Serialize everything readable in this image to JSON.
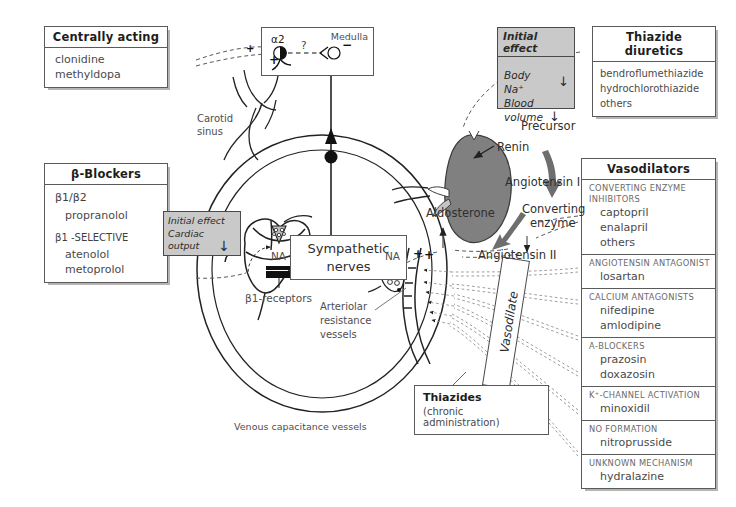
{
  "boxes": {
    "centrally_acting": {
      "header": "Centrally acting",
      "drugs": [
        "clonidine",
        "methyldopa"
      ]
    },
    "thiazide_diuretics": {
      "header": "Thiazide diuretics",
      "drugs": [
        "bendroflumethiazide",
        "hydrochlorothiazide",
        "others"
      ]
    },
    "beta_blockers": {
      "header": "β-Blockers",
      "group1_label": "β1/β2",
      "group1_drugs": [
        "propranolol"
      ],
      "group2_label": "β1 -SELECTIVE",
      "group2_drugs": [
        "atenolol",
        "metoprolol"
      ]
    },
    "vasodilators": {
      "header": "Vasodilators",
      "sections": [
        {
          "category": "CONVERTING ENZYME INHIBITORS",
          "drugs": [
            "captopril",
            "enalapril",
            "others"
          ]
        },
        {
          "category": "ANGIOTENSIN ANTAGONIST",
          "drugs": [
            "losartan"
          ]
        },
        {
          "category": "CALCIUM ANTAGONISTS",
          "drugs": [
            "nifedipine",
            "amlodipine"
          ]
        },
        {
          "category": "α-BLOCKERS",
          "drugs": [
            "prazosin",
            "doxazosin"
          ]
        },
        {
          "category": "K⁺-CHANNEL ACTIVATION",
          "drugs": [
            "minoxidil"
          ]
        },
        {
          "category": "NO FORMATION",
          "drugs": [
            "nitroprusside"
          ]
        },
        {
          "category": "UNKNOWN MECHANISM",
          "drugs": [
            "hydralazine"
          ]
        }
      ]
    },
    "thiazides_chronic": {
      "header": "Thiazides",
      "subtitle": "(chronic administration)"
    },
    "sympathetic_nerves": {
      "line1": "Sympathetic",
      "line2": "nerves"
    },
    "medulla": {
      "label": "Medulla",
      "receptor": "α2",
      "plus": "+",
      "question": "?",
      "minus": "−"
    }
  },
  "gray_boxes": {
    "initial_effect_sodium": {
      "header": "Initial effect",
      "line1": "Body Na⁺",
      "arrow1": "↓",
      "line2": "Blood",
      "line3": "volume",
      "arrow2": "↓"
    },
    "initial_effect_cardiac": {
      "line0": "Initial effect",
      "line1": "Cardiac",
      "line2": "output",
      "arrow": "↓"
    }
  },
  "labels": {
    "carotid_sinus_l1": "Carotid",
    "carotid_sinus_l2": "sinus",
    "precursor": "Precursor",
    "renin": "Renin",
    "angiotensin_i": "Angiotensin I",
    "converting_enzyme_l1": "Converting",
    "converting_enzyme_l2": "enzyme",
    "angiotensin_ii": "Angiotensin II",
    "aldosterone": "Aldosterone",
    "na_heart": "NA",
    "na_vessel": "NA",
    "beta1_receptors": "β1-receptors",
    "arteriolar_l1": "Arteriolar",
    "arteriolar_l2": "resistance",
    "arteriolar_l3": "vessels",
    "venous_capacitance": "Venous capacitance vessels",
    "vasodilate": "Vasodilate"
  },
  "signs": {
    "plus": "+",
    "minus": "−",
    "down_arrow": "↓"
  },
  "colors": {
    "kidney_fill": "#808080",
    "gray_panel": "#c9c9c9",
    "outline": "#222222",
    "text": "#4a4a4a",
    "header_text": "#1d1d1d"
  }
}
